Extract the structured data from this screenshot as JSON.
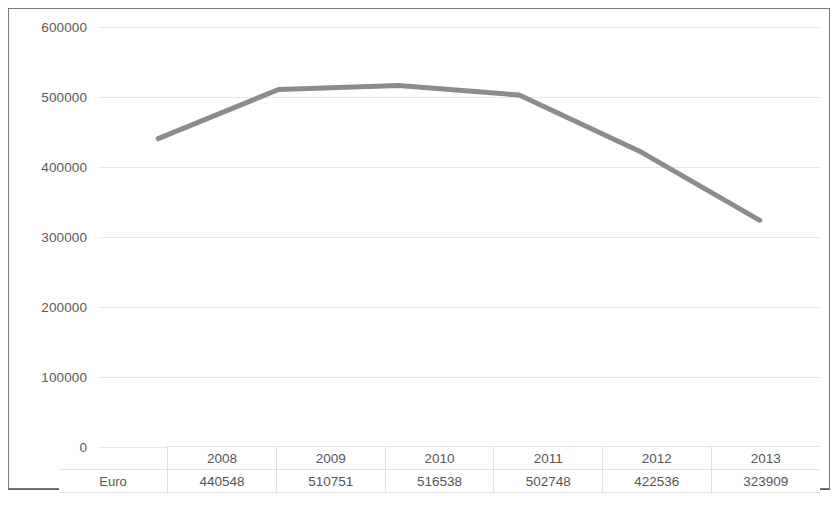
{
  "chart_data": {
    "type": "line",
    "title": "",
    "xlabel": "",
    "ylabel": "",
    "categories": [
      "2008",
      "2009",
      "2010",
      "2011",
      "2012",
      "2013"
    ],
    "series": [
      {
        "name": "Euro",
        "values": [
          440548,
          510751,
          516538,
          502748,
          422536,
          323909
        ],
        "color": "#8c8c8c"
      }
    ],
    "ylim": [
      0,
      600000
    ],
    "ytick_values": [
      0,
      100000,
      200000,
      300000,
      400000,
      500000,
      600000
    ],
    "ytick_labels": [
      "0",
      "100000",
      "200000",
      "300000",
      "400000",
      "500000",
      "600000"
    ],
    "grid": true,
    "legend_position": "data-table-left",
    "data_table_visible": true
  },
  "table": {
    "row_label": "Euro",
    "headers": [
      "2008",
      "2009",
      "2010",
      "2011",
      "2012",
      "2013"
    ],
    "values": [
      "440548",
      "510751",
      "516538",
      "502748",
      "422536",
      "323909"
    ]
  },
  "colors": {
    "series_line": "#8c8c8c",
    "gridline": "#e8e8e8",
    "axis_text": "#5a5a5a",
    "table_border": "#e0e0e0",
    "frame_border": "#7a7a7a"
  }
}
